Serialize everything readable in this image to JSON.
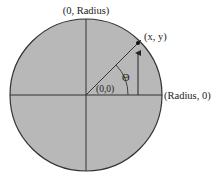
{
  "diagram": {
    "type": "unit-circle-polar-coordinates",
    "labels": {
      "top": "(0, Radius)",
      "right": "(Radius, 0)",
      "point": "(x, y)",
      "origin": "(0,0)",
      "angle": "Θ"
    },
    "colors": {
      "circle_fill": "#b8b8b8",
      "stroke": "#333333",
      "text": "#222222"
    }
  }
}
